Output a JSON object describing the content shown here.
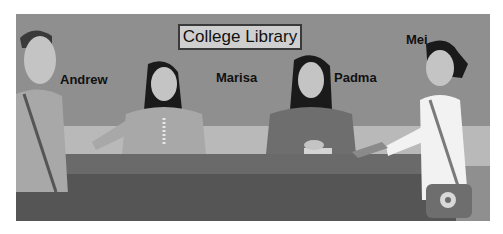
{
  "sign": {
    "text": "College Library"
  },
  "people": [
    {
      "name": "Andrew"
    },
    {
      "name": "Marisa"
    },
    {
      "name": "Padma"
    },
    {
      "name": "Mei"
    }
  ],
  "colors": {
    "background_wall": "#8f8f8f",
    "wall_band": "#b9b9b9",
    "desk_top": "#6a6a6a",
    "desk_front": "#555555",
    "sign_bg": "#cfcfcf"
  }
}
